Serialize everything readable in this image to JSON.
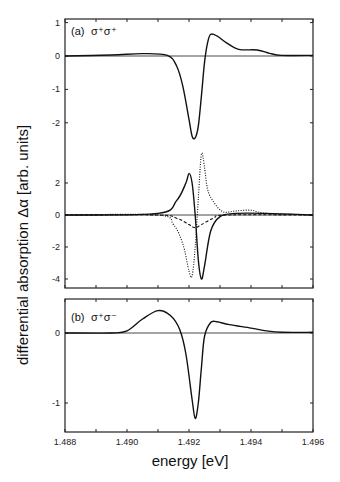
{
  "figure": {
    "ylabel": "differential absorption  Δα [arb. units]",
    "xlabel": "energy [eV]",
    "panel_a_label": "(a)",
    "panel_a_polarization": "σ⁺σ⁺",
    "panel_b_label": "(b)",
    "panel_b_polarization": "σ⁺σ⁻"
  },
  "chart_data": [
    {
      "type": "line",
      "title": "(a) σ+σ+",
      "xlabel": "energy [eV]",
      "ylabel": "differential absorption Δα [arb. units]",
      "xlim": [
        1.488,
        1.496
      ],
      "ylim": [
        -3,
        1
      ],
      "yticks": [
        1,
        0,
        -1,
        -2
      ],
      "xticks": [
        1.488,
        1.49,
        1.492,
        1.494,
        1.496
      ],
      "grid": false,
      "series": [
        {
          "name": "measured σ+σ+",
          "style": "solid",
          "x": [
            1.488,
            1.4895,
            1.4905,
            1.4913,
            1.4916,
            1.4918,
            1.492,
            1.4921,
            1.4922,
            1.4923,
            1.4924,
            1.4925,
            1.4926,
            1.4927,
            1.4929,
            1.4932,
            1.4936,
            1.4942,
            1.4946,
            1.495,
            1.496
          ],
          "y": [
            0.0,
            0.03,
            0.07,
            0.02,
            -0.3,
            -0.9,
            -1.9,
            -2.4,
            -2.45,
            -2.1,
            -1.2,
            -0.2,
            0.4,
            0.65,
            0.6,
            0.4,
            0.2,
            0.18,
            0.08,
            0.02,
            0.02
          ]
        }
      ]
    },
    {
      "type": "line",
      "title": "(a) model decomposition",
      "xlim": [
        1.488,
        1.496
      ],
      "ylim": [
        -4.5,
        4
      ],
      "yticks": [
        2,
        0,
        -2,
        -4
      ],
      "grid": false,
      "series": [
        {
          "name": "solid (sum)",
          "style": "solid",
          "x": [
            1.488,
            1.491,
            1.4916,
            1.4919,
            1.492,
            1.4921,
            1.4922,
            1.4923,
            1.4924,
            1.4925,
            1.4927,
            1.493,
            1.4935,
            1.4945,
            1.496
          ],
          "y": [
            0,
            0.1,
            0.9,
            2.0,
            2.6,
            2.0,
            0,
            -2.8,
            -4.0,
            -3.2,
            -1.0,
            -0.1,
            0.1,
            0.1,
            0
          ]
        },
        {
          "name": "dotted component 1",
          "style": "dotted",
          "x": [
            1.488,
            1.491,
            1.4915,
            1.4918,
            1.492,
            1.4921,
            1.4922,
            1.4923,
            1.4924,
            1.4925,
            1.4926,
            1.4928,
            1.4931,
            1.4935,
            1.494,
            1.4945,
            1.496
          ],
          "y": [
            0,
            0,
            -0.6,
            -1.8,
            -3.5,
            -3.8,
            -2.0,
            1.0,
            3.8,
            3.0,
            1.6,
            0.8,
            0.2,
            0.25,
            0.3,
            0.1,
            0
          ]
        },
        {
          "name": "dashed component 2",
          "style": "dashed",
          "x": [
            1.488,
            1.491,
            1.4916,
            1.492,
            1.4922,
            1.4924,
            1.4928,
            1.4932,
            1.496
          ],
          "y": [
            0,
            0,
            -0.2,
            -0.6,
            -0.8,
            -0.6,
            -0.2,
            0,
            0
          ]
        }
      ]
    },
    {
      "type": "line",
      "title": "(b) σ+σ-",
      "xlabel": "energy [eV]",
      "xlim": [
        1.488,
        1.496
      ],
      "ylim": [
        -1.4,
        0.45
      ],
      "yticks": [
        0,
        -1
      ],
      "xticks": [
        1.488,
        1.49,
        1.492,
        1.494,
        1.496
      ],
      "grid": false,
      "series": [
        {
          "name": "measured σ+σ-",
          "style": "solid",
          "x": [
            1.488,
            1.4895,
            1.49,
            1.4905,
            1.491,
            1.4914,
            1.4917,
            1.4919,
            1.4921,
            1.4922,
            1.4923,
            1.4924,
            1.4925,
            1.4927,
            1.4929,
            1.4933,
            1.494,
            1.4945,
            1.495,
            1.496
          ],
          "y": [
            0,
            0,
            0.03,
            0.2,
            0.32,
            0.25,
            0.05,
            -0.3,
            -0.95,
            -1.22,
            -1.0,
            -0.5,
            -0.05,
            0.15,
            0.16,
            0.12,
            0.07,
            0.03,
            0.01,
            0.01
          ]
        }
      ]
    }
  ]
}
